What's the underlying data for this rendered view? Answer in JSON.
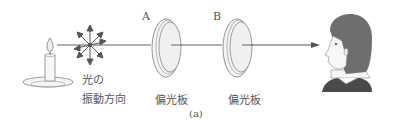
{
  "figure": {
    "caption": "(a)",
    "source_label_line1": "光の",
    "source_label_line2": "振動方向",
    "polarizer_a": {
      "letter": "A",
      "label": "偏光板"
    },
    "polarizer_b": {
      "letter": "B",
      "label": "偏光板"
    },
    "elements": [
      "candle-light-source",
      "vibration-direction-star",
      "polarizer-a",
      "polarizer-b",
      "observer-face"
    ],
    "colors": {
      "line": "#555555",
      "fill": "#f2f2f2",
      "hair": "#6e6e6e",
      "stroke": "#777777"
    }
  }
}
